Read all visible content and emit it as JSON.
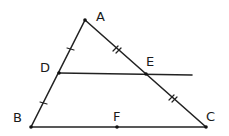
{
  "diagram": {
    "type": "geometry-triangle-midsegment",
    "points": {
      "A": {
        "label": "A",
        "x": 85,
        "y": 20,
        "lx": 96,
        "ly": 21
      },
      "B": {
        "label": "B",
        "x": 31,
        "y": 127,
        "lx": 13,
        "ly": 122
      },
      "C": {
        "label": "C",
        "x": 206,
        "y": 127,
        "lx": 206,
        "ly": 121
      },
      "D": {
        "label": "D",
        "x": 59,
        "y": 73,
        "lx": 40,
        "ly": 72
      },
      "E": {
        "label": "E",
        "x": 146,
        "y": 74,
        "lx": 146,
        "ly": 66
      },
      "F": {
        "label": "F",
        "x": 117,
        "y": 127,
        "lx": 113,
        "ly": 121
      }
    },
    "segments": [
      {
        "name": "AB",
        "from": "A",
        "to": "B"
      },
      {
        "name": "AC",
        "from": "A",
        "to": "C"
      },
      {
        "name": "BC",
        "from": "B",
        "to": "C"
      },
      {
        "name": "DE-extended",
        "from": "D",
        "to_xy": [
          192,
          75
        ]
      }
    ],
    "tick_marks": [
      {
        "segment": "AD",
        "count": 1
      },
      {
        "segment": "DB",
        "count": 1
      },
      {
        "segment": "AE",
        "count": 2
      },
      {
        "segment": "EC",
        "count": 2
      }
    ]
  }
}
